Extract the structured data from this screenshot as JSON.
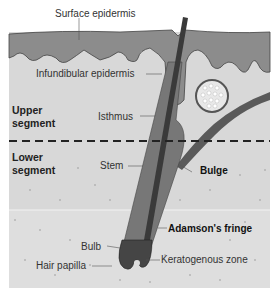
{
  "labels": {
    "surface_epidermis": "Surface epidermis",
    "infundibular_epidermis": "Infundibular epidermis",
    "isthmus": "Isthmus",
    "stem": "Stem",
    "bulge": "Bulge",
    "adamsons_fringe": "Adamson's fringe",
    "bulb": "Bulb",
    "hair_papilla": "Hair papilla",
    "keratogenous_zone": "Keratogenous zone"
  },
  "segments": {
    "upper": [
      "Upper",
      "segment"
    ],
    "lower": [
      "Lower",
      "segment"
    ]
  },
  "colors": {
    "epidermis": "#8a8a8a",
    "dermis": "#d6d6d6",
    "lower_dermis": "#dcdcdc",
    "hair_shaft": "#3a3a3a",
    "follicle": "#555555",
    "divider": "#222222"
  }
}
